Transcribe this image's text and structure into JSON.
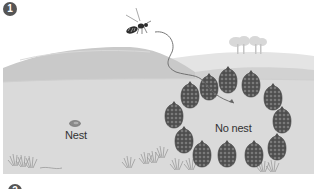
{
  "figure": {
    "step_badge": "1",
    "next_step_badge": "2",
    "labels": {
      "nest": "Nest",
      "no_nest": "No nest"
    },
    "colors": {
      "sky": "#ffffff",
      "far_hill": "#e4e4e4",
      "main_hill": "#c9c9c9",
      "ground": "#dadada",
      "pinecone": "#5a5a5a",
      "badge": "#555555",
      "wasp_path": "#666666"
    },
    "elements": {
      "wasp": "wasp-icon",
      "wasp_flight_path": "curved-arrow",
      "nest": "nest-oval",
      "pinecone_ring_count": 12,
      "trees": "tree-cluster",
      "grass": "grass-tufts"
    }
  }
}
